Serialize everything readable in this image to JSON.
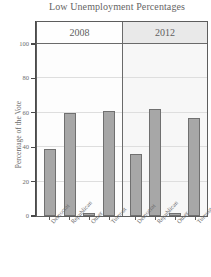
{
  "chart_data": {
    "type": "bar",
    "title": "Low Unemployment  Percentages",
    "xlabel": "",
    "ylabel": "Percentage of the Vote",
    "ylim": [
      0,
      100
    ],
    "yticks": [
      0,
      20,
      40,
      60,
      80,
      100
    ],
    "ytick_labels": [
      "0",
      "20",
      "40",
      "60",
      "80",
      "100"
    ],
    "grid": true,
    "legend": "none",
    "categories": [
      "Democrat",
      "Republican",
      "Other",
      "Turnout"
    ],
    "panels": [
      {
        "label": "2008",
        "categories": [
          "Democrat",
          "Republican",
          "Other",
          "Turnout"
        ],
        "values": [
          39,
          60,
          2,
          61
        ]
      },
      {
        "label": "2012",
        "categories": [
          "Democrat",
          "Republican",
          "Other",
          "Turnout"
        ],
        "values": [
          36,
          62,
          2,
          57
        ]
      }
    ],
    "series": [
      {
        "name": "2008",
        "values": [
          39,
          60,
          2,
          61
        ]
      },
      {
        "name": "2012",
        "values": [
          36,
          62,
          2,
          57
        ]
      }
    ],
    "colors": {
      "bar_fill": "#a7a7a7",
      "bar_outline": "#707070",
      "strip_2008": "#fefefe",
      "strip_2012": "#e9e9e9",
      "grid": "#dedede",
      "axis": "#4a4a4a",
      "text": "#6b6b6b"
    }
  }
}
